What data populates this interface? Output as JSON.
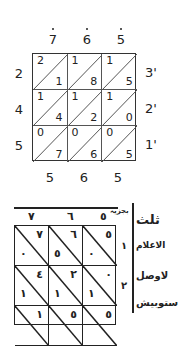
{
  "diagram": {
    "type": "lattice-multiplication",
    "modern": {
      "top_digits": [
        "7",
        "6",
        "5"
      ],
      "left_digits": [
        "2",
        "4",
        "5"
      ],
      "right_labels": [
        "3'",
        "2'",
        "1'"
      ],
      "bottom_digits": [
        "5",
        "6",
        "5"
      ],
      "cells": [
        [
          {
            "tl": "2",
            "br": "1"
          },
          {
            "tl": "1",
            "br": "8"
          },
          {
            "tl": "1",
            "br": "5"
          }
        ],
        [
          {
            "tl": "1",
            "br": "4"
          },
          {
            "tl": "1",
            "br": "2"
          },
          {
            "tl": "1",
            "br": "0"
          }
        ],
        [
          {
            "tl": "0",
            "br": "7"
          },
          {
            "tl": "0",
            "br": "6"
          },
          {
            "tl": "0",
            "br": "5"
          }
        ]
      ]
    },
    "historical": {
      "top_digits": [
        "٧",
        "٦",
        "٥"
      ],
      "header_note": "بجزیہ",
      "row_labels": [
        "١",
        "٢"
      ],
      "cells": [
        [
          {
            "tr": "٧",
            "bl": "٠"
          },
          {
            "tr": "٦",
            "bl": "٥"
          },
          {
            "tr": "٥",
            "bl": "٠"
          }
        ],
        [
          {
            "tr": "٤",
            "bl": "١"
          },
          {
            "tr": "٢",
            "bl": "١"
          },
          {
            "tr": "٠",
            "bl": "١"
          }
        ],
        [
          {
            "tr": "١",
            "bl": ""
          },
          {
            "tr": "٥",
            "bl": ""
          },
          {
            "tr": "٥",
            "bl": ""
          }
        ]
      ],
      "margin_text": [
        "ثلث",
        "الاعلام",
        "لاوصل",
        "ستوبيش"
      ]
    }
  }
}
